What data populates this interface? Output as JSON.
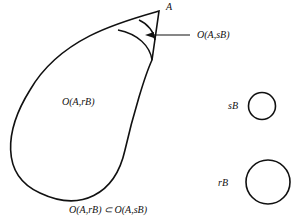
{
  "diagram": {
    "point_label": "A",
    "outer_region_label": "O(A,sB)",
    "inner_region_label": "O(A,rB)",
    "small_ball_label": "sB",
    "large_ball_label": "rB",
    "caption": "O(A,rB) ⊂ O(A,sB)",
    "stroke_color": "#111111",
    "background": "#ffffff"
  }
}
